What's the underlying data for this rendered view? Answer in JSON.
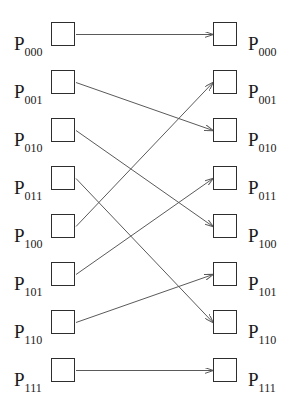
{
  "diagram": {
    "title": "",
    "type": "perfect-shuffle-interconnection",
    "label_prefix": "P",
    "left_nodes": [
      {
        "id": "000",
        "prefix": "P",
        "sub": "000"
      },
      {
        "id": "001",
        "prefix": "P",
        "sub": "001"
      },
      {
        "id": "010",
        "prefix": "P",
        "sub": "010"
      },
      {
        "id": "011",
        "prefix": "P",
        "sub": "011"
      },
      {
        "id": "100",
        "prefix": "P",
        "sub": "100"
      },
      {
        "id": "101",
        "prefix": "P",
        "sub": "101"
      },
      {
        "id": "110",
        "prefix": "P",
        "sub": "110"
      },
      {
        "id": "111",
        "prefix": "P",
        "sub": "111"
      }
    ],
    "right_nodes": [
      {
        "id": "000",
        "prefix": "P",
        "sub": "000"
      },
      {
        "id": "001",
        "prefix": "P",
        "sub": "001"
      },
      {
        "id": "010",
        "prefix": "P",
        "sub": "010"
      },
      {
        "id": "011",
        "prefix": "P",
        "sub": "011"
      },
      {
        "id": "100",
        "prefix": "P",
        "sub": "100"
      },
      {
        "id": "101",
        "prefix": "P",
        "sub": "101"
      },
      {
        "id": "110",
        "prefix": "P",
        "sub": "110"
      },
      {
        "id": "111",
        "prefix": "P",
        "sub": "111"
      }
    ],
    "edges": [
      {
        "from": 0,
        "to": 0
      },
      {
        "from": 1,
        "to": 2
      },
      {
        "from": 2,
        "to": 4
      },
      {
        "from": 3,
        "to": 6
      },
      {
        "from": 4,
        "to": 1
      },
      {
        "from": 5,
        "to": 3
      },
      {
        "from": 6,
        "to": 5
      },
      {
        "from": 7,
        "to": 7
      }
    ],
    "colors": {
      "box_border": "#2e2e2e",
      "edge": "#5a5a5a",
      "label": "#1a1a1a",
      "background": "#ffffff"
    }
  }
}
